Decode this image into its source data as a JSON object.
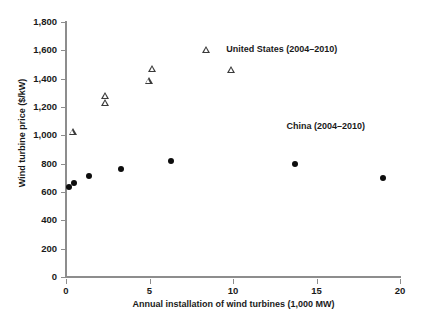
{
  "chart_data": {
    "type": "scatter",
    "title": "",
    "xlabel": "Annual installation of wind turbines (1,000 MW)",
    "ylabel": "Wind turbine price ($/kW)",
    "xlim": [
      0,
      20
    ],
    "ylim": [
      0,
      1800
    ],
    "xticks": [
      "0",
      "5",
      "10",
      "15",
      "20"
    ],
    "xtick_values": [
      0,
      5,
      10,
      15,
      20
    ],
    "yticks": [
      "0",
      "200",
      "400",
      "600",
      "800",
      "1,000",
      "1,200",
      "1,400",
      "1,600",
      "1,800"
    ],
    "ytick_values": [
      0,
      200,
      400,
      600,
      800,
      1000,
      1200,
      1400,
      1600,
      1800
    ],
    "grid": false,
    "legend_position": "inline-annotation",
    "series": [
      {
        "name": "United States (2004–2010)",
        "marker": "open-triangle",
        "color": "#3a3a3a",
        "points": [
          {
            "x": 0.4,
            "y": 1025
          },
          {
            "x": 2.35,
            "y": 1280
          },
          {
            "x": 2.35,
            "y": 1235
          },
          {
            "x": 5.15,
            "y": 1470
          },
          {
            "x": 4.95,
            "y": 1390
          },
          {
            "x": 8.4,
            "y": 1605
          },
          {
            "x": 9.9,
            "y": 1465
          }
        ],
        "annotation": {
          "text": "United States (2004–2010)",
          "x": 9.6,
          "y": 1600
        }
      },
      {
        "name": "China (2004–2010)",
        "marker": "filled-circle",
        "color": "#0d0d0d",
        "points": [
          {
            "x": 0.2,
            "y": 635
          },
          {
            "x": 0.5,
            "y": 665
          },
          {
            "x": 1.35,
            "y": 710
          },
          {
            "x": 3.3,
            "y": 765
          },
          {
            "x": 6.3,
            "y": 820
          },
          {
            "x": 13.7,
            "y": 800
          },
          {
            "x": 19.0,
            "y": 700
          }
        ],
        "annotation": {
          "text": "China (2004–2010)",
          "x": 13.2,
          "y": 1060
        }
      }
    ]
  }
}
